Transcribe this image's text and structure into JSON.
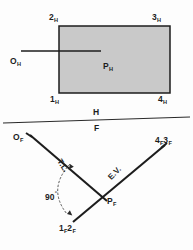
{
  "drawing": {
    "title": "Descriptive geometry: plane 1-2-3-4 with point O, H and F views",
    "type": "engineering-orthographic-projection",
    "line_color": "#1d1d1d",
    "plane_fill_color": "#c9c9c9",
    "background_color": "#fdfdfd"
  },
  "top_view": {
    "view_label": "H",
    "plane_name": "plane-1-2-3-4-H",
    "corner_labels": {
      "top_left": {
        "number": "2",
        "subscript": "H"
      },
      "top_right": {
        "number": "3",
        "subscript": "H"
      },
      "bottom_left": {
        "number": "1",
        "subscript": "H"
      },
      "bottom_right": {
        "number": "4",
        "subscript": "H"
      }
    },
    "point_in_plane": {
      "number": "P",
      "subscript": "H"
    },
    "external_point": {
      "number": "O",
      "subscript": "H"
    },
    "connector_name": "perpendicular-line-O-to-P-H"
  },
  "fold_line": {
    "name": "fold-line-H-F",
    "upper_label": "H",
    "lower_label": "F"
  },
  "front_view": {
    "view_label": "F",
    "edge_view_line_name": "edge-view-line-1F2F-to-4F3F",
    "labels": {
      "point_O": {
        "number": "O",
        "subscript": "F"
      },
      "point_P": {
        "number": "P",
        "subscript": "F"
      },
      "bottom_edge": [
        {
          "number": "1",
          "subscript": "F"
        },
        {
          "number": "2",
          "subscript": "F"
        }
      ],
      "upper_right_edge": [
        {
          "number": "4",
          "subscript": "F"
        },
        {
          "number": "3",
          "subscript": "F"
        }
      ]
    },
    "annotations": {
      "true_length": "T.L.",
      "edge_view": "E.V.",
      "angle_value": "90",
      "angle_unit": "°"
    }
  }
}
